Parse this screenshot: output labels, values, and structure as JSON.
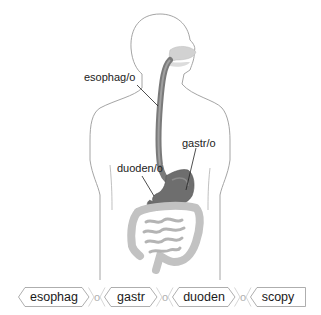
{
  "figure": {
    "labels": {
      "esophagus": "esophag/o",
      "stomach": "gastr/o",
      "duodenum": "duoden/o"
    },
    "colors": {
      "outline": "#9a9a9a",
      "organ_dark": "#6e6e6e",
      "organ_mid": "#8c8c8c",
      "intestine": "#c8c8c8",
      "leader": "#222222"
    }
  },
  "word_parts": {
    "items": [
      {
        "type": "root",
        "text": "esophag"
      },
      {
        "type": "combining_vowel",
        "text": "o"
      },
      {
        "type": "root",
        "text": "gastr"
      },
      {
        "type": "combining_vowel",
        "text": "o"
      },
      {
        "type": "root",
        "text": "duoden"
      },
      {
        "type": "combining_vowel",
        "text": "o"
      },
      {
        "type": "suffix",
        "text": "scopy"
      }
    ]
  }
}
